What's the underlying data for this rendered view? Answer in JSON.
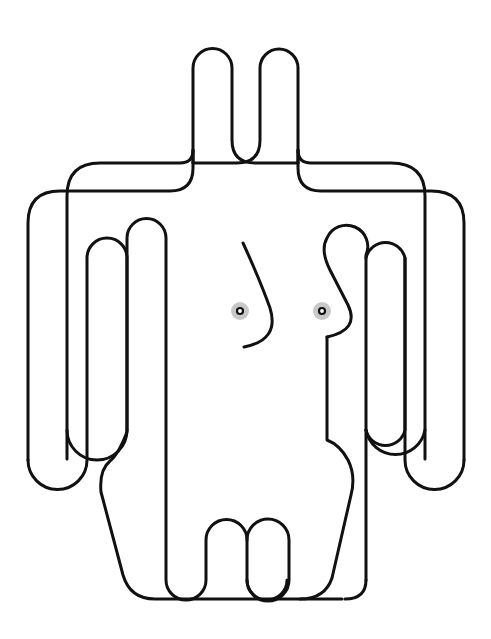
{
  "artwork": {
    "subject": "continuous-line figure of a human torso with arms, head loops and legs",
    "background_color": "#ffffff",
    "stroke_color": "#111111",
    "nipple_halo_color": "#c8c8c8",
    "canvas": {
      "width": 491,
      "height": 639
    }
  }
}
